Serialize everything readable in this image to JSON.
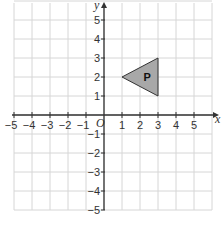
{
  "diagram": {
    "type": "coordinate-grid",
    "x_axis": {
      "label": "x",
      "min": -5,
      "max": 5,
      "ticks": [
        "-5",
        "-4",
        "-3",
        "-2",
        "-1",
        "1",
        "2",
        "3",
        "4",
        "5"
      ]
    },
    "y_axis": {
      "label": "y",
      "min": -5,
      "max": 5,
      "ticks": [
        "5",
        "4",
        "3",
        "2",
        "1",
        "-1",
        "-2",
        "-3",
        "-4",
        "-5"
      ]
    },
    "origin_label": "O",
    "shape": {
      "label": "P",
      "vertices": [
        [
          1,
          2
        ],
        [
          3,
          3
        ],
        [
          3,
          1
        ]
      ],
      "fill": "#a8a8a8",
      "stroke": "#333333"
    },
    "grid_color": "#d6d6d6"
  }
}
